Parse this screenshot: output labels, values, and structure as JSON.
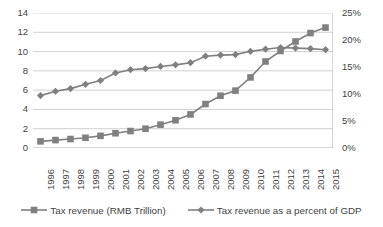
{
  "chart_data": {
    "type": "line",
    "title": "",
    "subtitle": "",
    "xlabel": "",
    "ylabel": "",
    "y2label": "",
    "grid": true,
    "legend_position": "bottom",
    "categories": [
      "1996",
      "1997",
      "1998",
      "1999",
      "2000",
      "2001",
      "2002",
      "2003",
      "2004",
      "2005",
      "2006",
      "2007",
      "2008",
      "2009",
      "2010",
      "2011",
      "2012",
      "2013",
      "2014",
      "2015"
    ],
    "ylim": [
      0,
      14
    ],
    "yticks": [
      "0",
      "2",
      "4",
      "6",
      "8",
      "10",
      "12",
      "14"
    ],
    "ytick_values": [
      0,
      2,
      4,
      6,
      8,
      10,
      12,
      14
    ],
    "y2lim": [
      0,
      25
    ],
    "y2ticks": [
      "0%",
      "5%",
      "10%",
      "15%",
      "20%",
      "25%"
    ],
    "y2tick_values": [
      0,
      5,
      10,
      15,
      20,
      25
    ],
    "series": [
      {
        "name": "Tax revenue (RMB Trillion)",
        "axis": "left",
        "marker": "square",
        "color": "#808080",
        "values": [
          0.69,
          0.82,
          0.93,
          1.06,
          1.26,
          1.53,
          1.76,
          2.0,
          2.42,
          2.88,
          3.48,
          4.56,
          5.42,
          5.95,
          7.32,
          8.97,
          10.06,
          11.05,
          11.92,
          12.49
        ]
      },
      {
        "name": "Tax revenue as a percent of GDP",
        "axis": "right",
        "marker": "diamond",
        "color": "#808080",
        "values": [
          9.7,
          10.5,
          11.0,
          11.8,
          12.5,
          13.9,
          14.5,
          14.7,
          15.1,
          15.4,
          15.8,
          17.0,
          17.2,
          17.3,
          17.9,
          18.3,
          18.6,
          18.5,
          18.4,
          18.2
        ]
      }
    ]
  },
  "legend": {
    "items": [
      {
        "label": "Tax revenue (RMB Trillion)",
        "marker": "square"
      },
      {
        "label": "Tax revenue as a percent of GDP",
        "marker": "diamond"
      }
    ]
  }
}
